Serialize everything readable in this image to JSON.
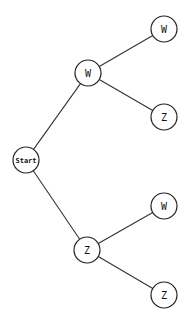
{
  "diagram": {
    "type": "probability-tree",
    "colors": {
      "stroke": "#222222",
      "fill": "#ffffff",
      "background": "#ffffff"
    },
    "nodes": [
      {
        "id": "start",
        "label": "Start",
        "x": 26,
        "y": 160,
        "r": 13
      },
      {
        "id": "w1",
        "label": "W",
        "x": 88,
        "y": 73,
        "r": 13
      },
      {
        "id": "z1",
        "label": "Z",
        "x": 87,
        "y": 250,
        "r": 13
      },
      {
        "id": "w1w",
        "label": "W",
        "x": 164,
        "y": 29,
        "r": 13
      },
      {
        "id": "w1z",
        "label": "Z",
        "x": 164,
        "y": 117,
        "r": 13
      },
      {
        "id": "z1w",
        "label": "W",
        "x": 164,
        "y": 206,
        "r": 13
      },
      {
        "id": "z1z",
        "label": "Z",
        "x": 164,
        "y": 295,
        "r": 13
      }
    ],
    "edges": [
      {
        "from": "start",
        "to": "w1"
      },
      {
        "from": "start",
        "to": "z1"
      },
      {
        "from": "w1",
        "to": "w1w"
      },
      {
        "from": "w1",
        "to": "w1z"
      },
      {
        "from": "z1",
        "to": "z1w"
      },
      {
        "from": "z1",
        "to": "z1z"
      }
    ]
  }
}
